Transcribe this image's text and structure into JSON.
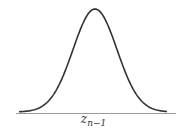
{
  "figure": {
    "curve": "gaussian-bell-curve",
    "axis_label": {
      "base": "z",
      "subscript": "n−1"
    },
    "colors": {
      "curve": "#333333",
      "axis": "#999999",
      "background": "#ffffff"
    }
  }
}
